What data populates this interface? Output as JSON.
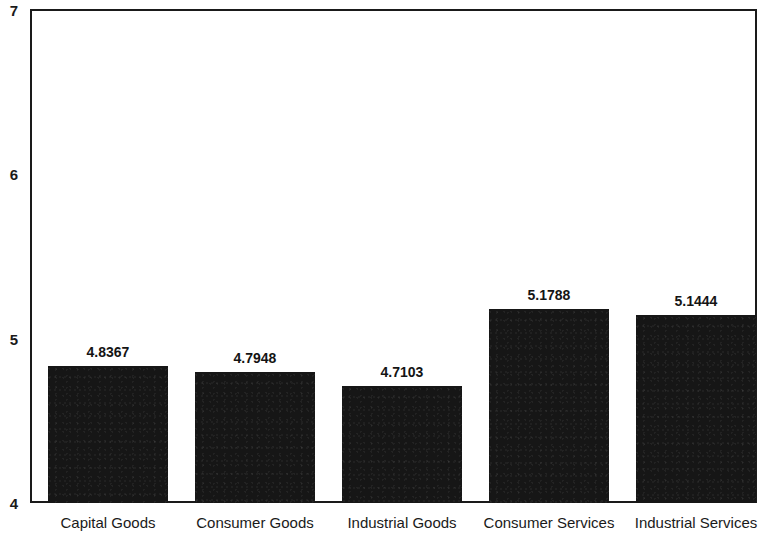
{
  "chart_data": {
    "type": "bar",
    "title": "",
    "subtitle": "",
    "xlabel": "",
    "ylabel": "",
    "categories": [
      "Capital Goods",
      "Consumer Goods",
      "Industrial Goods",
      "Consumer Services",
      "Industrial Services"
    ],
    "values": [
      4.8367,
      4.7948,
      4.7103,
      5.1788,
      5.1444
    ],
    "value_labels": [
      "4.8367",
      "4.7948",
      "4.7103",
      "5.1788",
      "5.1444"
    ],
    "ylim": [
      4,
      7
    ],
    "yticks": [
      4,
      5,
      6,
      7
    ],
    "ytick_labels": [
      "4",
      "5",
      "6",
      "7"
    ],
    "grid": false,
    "legend": null,
    "legend_position": "none",
    "bar_color": "#161616",
    "axis_color": "#1a1a1a",
    "background_color": "#ffffff"
  },
  "axis": {
    "y_ticks": [
      {
        "label": "7",
        "value": 7
      },
      {
        "label": "6",
        "value": 6
      },
      {
        "label": "5",
        "value": 5
      },
      {
        "label": "4",
        "value": 4
      }
    ]
  },
  "bars": [
    {
      "category": "Capital Goods",
      "value": 4.8367,
      "label": "4.8367"
    },
    {
      "category": "Consumer Goods",
      "value": 4.7948,
      "label": "4.7948"
    },
    {
      "category": "Industrial Goods",
      "value": 4.7103,
      "label": "4.7103"
    },
    {
      "category": "Consumer Services",
      "value": 5.1788,
      "label": "5.1788"
    },
    {
      "category": "Industrial Services",
      "value": 5.1444,
      "label": "5.1444"
    }
  ]
}
